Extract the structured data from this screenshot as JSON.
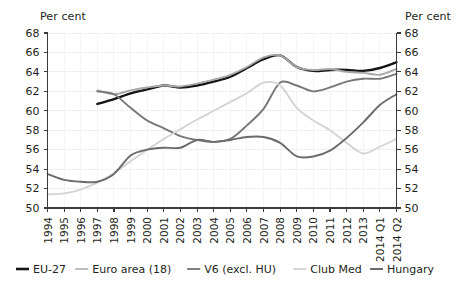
{
  "labels": {
    "unit_left": "Per cent",
    "unit_right": "Per cent"
  },
  "chart_data": {
    "type": "line",
    "title": "",
    "xlabel": "",
    "ylabel": "Per cent",
    "ylim": [
      50,
      68
    ],
    "ytick_step": 2,
    "yticks": [
      50,
      52,
      54,
      56,
      58,
      60,
      62,
      64,
      66,
      68
    ],
    "grid": true,
    "legend_position": "bottom",
    "dual_axis": true,
    "categories": [
      "1994",
      "1995",
      "1996",
      "1997",
      "1998",
      "1999",
      "2000",
      "2001",
      "2002",
      "2003",
      "2004",
      "2005",
      "2006",
      "2007",
      "2008",
      "2009",
      "2010",
      "2011",
      "2012",
      "2013",
      "2014 Q1",
      "2014 Q2"
    ],
    "series": [
      {
        "name": "EU-27",
        "color": "#141414",
        "width": 2.4,
        "values": [
          null,
          null,
          null,
          60.7,
          61.2,
          61.8,
          62.2,
          62.6,
          62.4,
          62.6,
          63.0,
          63.5,
          64.4,
          65.3,
          65.7,
          64.5,
          64.1,
          64.2,
          64.2,
          64.1,
          64.4,
          65.0
        ]
      },
      {
        "name": "Euro area (18)",
        "color": "#a8a8a8",
        "width": 1.9,
        "values": [
          null,
          null,
          null,
          62.1,
          61.7,
          62.1,
          62.4,
          62.6,
          62.5,
          62.8,
          63.2,
          63.7,
          64.5,
          65.5,
          65.7,
          64.5,
          64.2,
          64.3,
          64.0,
          63.9,
          63.7,
          64.3
        ]
      },
      {
        "name": "V6 (excl. HU)",
        "color": "#777777",
        "width": 1.9,
        "values": [
          null,
          null,
          null,
          62.0,
          61.7,
          60.3,
          59.0,
          58.2,
          57.4,
          57.0,
          56.8,
          57.1,
          58.5,
          60.2,
          62.9,
          62.6,
          62.0,
          62.4,
          63.0,
          63.3,
          63.3,
          63.8
        ]
      },
      {
        "name": "Club Med",
        "color": "#d3d3d3",
        "width": 1.9,
        "values": [
          51.4,
          51.5,
          51.9,
          52.6,
          53.6,
          54.8,
          56.0,
          57.1,
          58.1,
          59.1,
          60.0,
          60.9,
          61.8,
          62.9,
          62.6,
          60.3,
          59.0,
          58.0,
          56.7,
          55.6,
          56.3,
          57.1
        ]
      },
      {
        "name": "Hungary",
        "color": "#6b6b6b",
        "width": 1.9,
        "values": [
          53.5,
          52.9,
          52.7,
          52.7,
          53.5,
          55.4,
          56.0,
          56.2,
          56.2,
          57.0,
          56.8,
          57.0,
          57.3,
          57.3,
          56.7,
          55.3,
          55.3,
          55.9,
          57.2,
          58.8,
          60.6,
          61.7
        ]
      }
    ]
  },
  "legend": {
    "items": [
      {
        "label": "EU-27",
        "color": "#141414"
      },
      {
        "label": "Euro area (18)",
        "color": "#bdbdbd"
      },
      {
        "label": "V6 (excl. HU)",
        "color": "#808080"
      },
      {
        "label": "Club Med",
        "color": "#d6d6d6"
      },
      {
        "label": "Hungary",
        "color": "#6b6b6b"
      }
    ]
  }
}
